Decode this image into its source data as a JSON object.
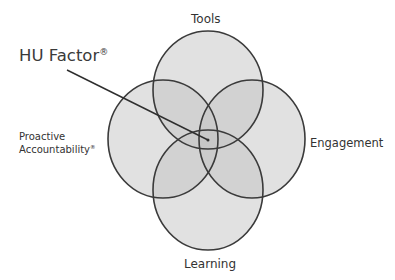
{
  "diagram": {
    "title_label": "HU Factor",
    "title_mark": "®",
    "circles": [
      {
        "id": "tools",
        "label": "Tools",
        "cx": 208,
        "cy": 90,
        "rx": 55,
        "ry": 59
      },
      {
        "id": "proactive",
        "label": "Proactive Accountability",
        "cx": 163,
        "cy": 139,
        "rx": 55,
        "ry": 59
      },
      {
        "id": "engagement",
        "label": "Engagement",
        "cx": 252,
        "cy": 139,
        "rx": 53,
        "ry": 59
      },
      {
        "id": "learning",
        "label": "Learning",
        "cx": 208,
        "cy": 190,
        "rx": 55,
        "ry": 60
      }
    ],
    "labels": {
      "tools": "Tools",
      "engagement": "Engagement",
      "learning": "Learning",
      "proactive_line1": "Proactive",
      "proactive_line2": "Accountability",
      "proactive_mark": "®"
    },
    "pointer": {
      "from": [
        67,
        70
      ],
      "to": [
        208,
        140
      ]
    },
    "colors": {
      "fill": "#b8b8b8",
      "stroke": "#3a3a3a",
      "text": "#333333"
    }
  }
}
